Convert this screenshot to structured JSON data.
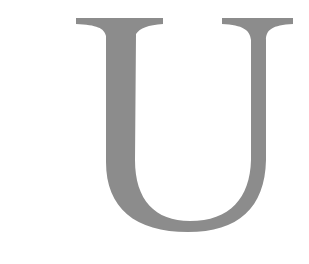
{
  "glyph": {
    "character": "U",
    "style": "serif",
    "color": "#8c8c8c"
  },
  "background": "#ffffff"
}
